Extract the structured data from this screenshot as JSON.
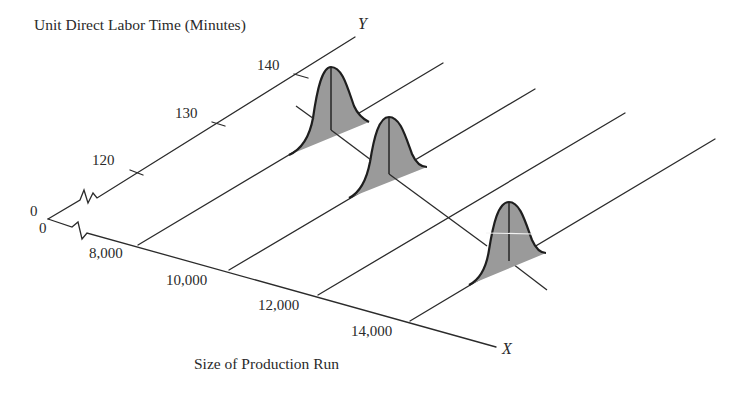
{
  "diagram": {
    "y_axis_title": "Unit Direct Labor Time (Minutes)",
    "y_axis_letter": "Y",
    "x_axis_title": "Size of Production Run",
    "x_axis_letter": "X",
    "origin_labels": {
      "y_zero": "0",
      "x_zero": "0"
    },
    "y_ticks": [
      {
        "label": "120",
        "value": 120
      },
      {
        "label": "130",
        "value": 130
      },
      {
        "label": "140",
        "value": 140
      }
    ],
    "x_ticks": [
      {
        "label": "8,000",
        "value": 8000
      },
      {
        "label": "10,000",
        "value": 10000
      },
      {
        "label": "12,000",
        "value": 12000
      },
      {
        "label": "14,000",
        "value": 14000
      }
    ],
    "distributions": [
      {
        "at_x": 8000,
        "type": "normal-curve"
      },
      {
        "at_x": 10000,
        "type": "normal-curve"
      },
      {
        "at_x": 14000,
        "type": "normal-curve"
      }
    ],
    "regression_line": "descending line through distribution means",
    "colors": {
      "line": "#2b2b2b",
      "fill": "#9a9a9a"
    }
  }
}
